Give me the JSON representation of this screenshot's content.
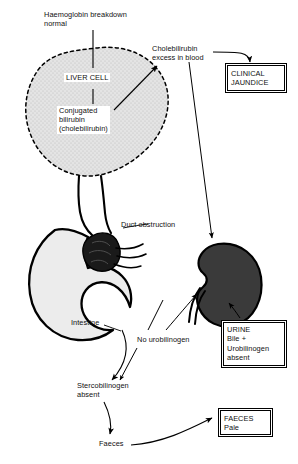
{
  "figure": {
    "colors": {
      "liver_fill": "#dedede",
      "stomach_fill": "#ececec",
      "kidney_fill": "#3a3a3a",
      "obstruction_fill": "#1a1a1a",
      "stroke": "#000000",
      "text": "#111111",
      "background": "#ffffff"
    }
  },
  "labels": {
    "haemoglobin": "Haemoglobin breakdown\nnormal",
    "liver_cell": "LIVER CELL",
    "conjugated": "Conjugated\nbilirubin\n(cholebilirubin)",
    "cholebilirubin_excess": "Cholebilirubin\nexcess in blood",
    "duct_obstruction": "Duct obstruction",
    "intestine": "Intestine",
    "no_urobilinogen": "No urobilinogen",
    "stercobilinogen": "Stercobilinogen\nabsent",
    "faeces": "Faeces"
  },
  "boxes": {
    "clinical_jaundice": "CLINICAL\nJAUNDICE",
    "urine": "URINE\nBile +\nUrobilinogen\nabsent",
    "faeces_pale": "FAECES\nPale"
  },
  "organs": {
    "liver": "liver-cell-blob",
    "stomach": "stomach-duodenum",
    "kidney": "kidney",
    "obstruction": "duct-obstruction-mass"
  }
}
